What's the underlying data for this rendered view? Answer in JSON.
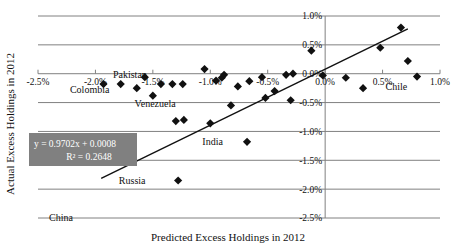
{
  "chart_data": {
    "type": "scatter",
    "title": "",
    "xlabel": "Predicted Excess Holdings in 2012",
    "ylabel": "Actual Excess Holdings in 2012",
    "xlim": [
      -2.5,
      1.0
    ],
    "ylim": [
      -2.5,
      1.0
    ],
    "grid": true,
    "legend": "none",
    "xticks": [
      "-2.5%",
      "-2.0%",
      "-1.5%",
      "-1.0%",
      "-0.5%",
      "0.0%",
      "0.5%",
      "1.0%"
    ],
    "xtick_values": [
      -2.5,
      -2.0,
      -1.5,
      -1.0,
      -0.5,
      0.0,
      0.5,
      1.0
    ],
    "yticks": [
      "1.0%",
      "0.5%",
      "0.0%",
      "-0.5%",
      "-1.0%",
      "-1.5%",
      "-2.0%",
      "-2.5%"
    ],
    "ytick_values": [
      1.0,
      0.5,
      0.0,
      -0.5,
      -1.0,
      -1.5,
      -2.0,
      -2.5
    ],
    "trendline": {
      "equation": "y = 0.9702x + 0.0008",
      "r_squared": "R² = 0.2648",
      "slope": 0.9702,
      "intercept": 0.08,
      "x_start": -1.95,
      "x_end": 0.72
    },
    "points": [
      {
        "x": -1.93,
        "y": -0.18,
        "label": ""
      },
      {
        "x": -1.78,
        "y": -0.18,
        "label": ""
      },
      {
        "x": -1.64,
        "y": -0.25,
        "label": ""
      },
      {
        "x": -1.57,
        "y": -0.06,
        "label": ""
      },
      {
        "x": -1.5,
        "y": -0.38,
        "label": ""
      },
      {
        "x": -1.43,
        "y": -0.18,
        "label": ""
      },
      {
        "x": -1.33,
        "y": -0.18,
        "label": ""
      },
      {
        "x": -1.24,
        "y": -0.18,
        "label": ""
      },
      {
        "x": -1.05,
        "y": 0.08,
        "label": ""
      },
      {
        "x": -0.95,
        "y": -0.12,
        "label": ""
      },
      {
        "x": -0.9,
        "y": -0.07,
        "label": ""
      },
      {
        "x": -0.88,
        "y": -0.02,
        "label": ""
      },
      {
        "x": -0.82,
        "y": -0.55,
        "label": ""
      },
      {
        "x": -0.76,
        "y": -0.22,
        "label": ""
      },
      {
        "x": -0.66,
        "y": -0.13,
        "label": ""
      },
      {
        "x": -0.55,
        "y": -0.06,
        "label": ""
      },
      {
        "x": -0.52,
        "y": -0.42,
        "label": ""
      },
      {
        "x": -0.44,
        "y": -0.3,
        "label": ""
      },
      {
        "x": -0.34,
        "y": -0.02,
        "label": ""
      },
      {
        "x": -0.3,
        "y": -0.46,
        "label": ""
      },
      {
        "x": -0.28,
        "y": 0.0,
        "label": ""
      },
      {
        "x": -1.3,
        "y": -0.82,
        "label": ""
      },
      {
        "x": -1.23,
        "y": -0.8,
        "label": ""
      },
      {
        "x": -1.0,
        "y": -0.86,
        "label": ""
      },
      {
        "x": -0.12,
        "y": 0.4,
        "label": ""
      },
      {
        "x": -0.02,
        "y": -0.03,
        "label": ""
      },
      {
        "x": 0.18,
        "y": -0.07,
        "label": ""
      },
      {
        "x": 0.33,
        "y": -0.25,
        "label": ""
      },
      {
        "x": 0.48,
        "y": 0.45,
        "label": ""
      },
      {
        "x": 0.66,
        "y": 0.8,
        "label": ""
      },
      {
        "x": 0.72,
        "y": 0.22,
        "label": ""
      },
      {
        "x": 0.8,
        "y": -0.05,
        "label": "Chile"
      },
      {
        "x": -0.68,
        "y": -1.18,
        "label": "India"
      },
      {
        "x": -1.28,
        "y": -1.85,
        "label": "Russia"
      }
    ],
    "annotations": [
      {
        "text": "Pakistan",
        "x": -1.7,
        "y": -0.02
      },
      {
        "text": "Colombia",
        "x": -2.05,
        "y": -0.28
      },
      {
        "text": "Venezuela",
        "x": -1.48,
        "y": -0.52
      },
      {
        "text": "India",
        "x": -0.98,
        "y": -1.18
      },
      {
        "text": "Russia",
        "x": -1.68,
        "y": -1.85
      },
      {
        "text": "China",
        "x": -2.3,
        "y": -2.5
      },
      {
        "text": "Chile",
        "x": 0.62,
        "y": -0.22
      }
    ]
  },
  "equation_box": {
    "line1": "y = 0.9702x + 0.0008",
    "line2": "R² = 0.2648",
    "background": "#808080",
    "text_color": "#ffffff"
  },
  "axis_titles": {
    "x": "Predicted Excess Holdings in 2012",
    "y": "Actual Excess Holdings in 2012"
  },
  "colors": {
    "marker": "#111111",
    "gridline": "#808080",
    "trendline": "#111111",
    "background": "#ffffff"
  }
}
